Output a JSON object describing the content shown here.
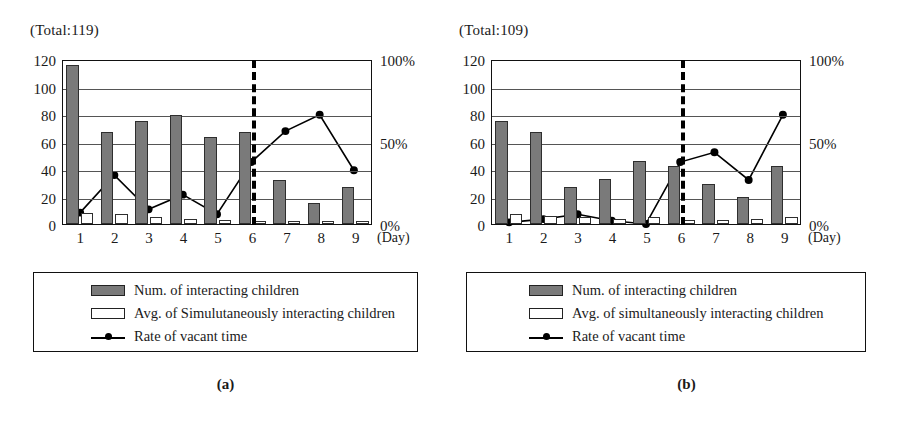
{
  "panels": [
    {
      "key": "a",
      "caption": "(a)",
      "total_label": "(Total:119)",
      "xaxis_title": "(Day)",
      "legend": {
        "bar_filled": "Num. of interacting children",
        "bar_hollow": "Avg. of Simulutaneously interacting children",
        "line": "Rate of vacant time"
      },
      "chart_data": {
        "type": "bar",
        "title": "(Total:119)",
        "xlabel": "(Day)",
        "ylabel": "",
        "y2label": "",
        "ylim": [
          0,
          120
        ],
        "y2lim": [
          0,
          100
        ],
        "yticks": [
          0,
          20,
          40,
          60,
          80,
          100,
          120
        ],
        "ytick_labels": [
          "0",
          "20",
          "40",
          "60",
          "80",
          "100",
          "120"
        ],
        "y2ticks": [
          0,
          50,
          100
        ],
        "y2tick_labels": [
          "0%",
          "50%",
          "100%"
        ],
        "grid": true,
        "legend_position": "below",
        "categories": [
          "1",
          "2",
          "3",
          "4",
          "5",
          "6",
          "7",
          "8",
          "9"
        ],
        "annotations": [
          {
            "type": "vertical-dashed-line",
            "x": 5.5,
            "label": ""
          }
        ],
        "series": [
          {
            "name": "Num. of interacting children",
            "type": "bar",
            "axis": "left",
            "values": [
              116,
              67,
              75,
              79,
              63,
              67,
              32,
              15,
              27
            ]
          },
          {
            "name": "Avg. of Simulutaneously interacting children",
            "type": "bar",
            "axis": "left",
            "values": [
              8,
              7,
              5,
              4,
              3,
              2,
              2,
              2,
              2
            ]
          },
          {
            "name": "Rate of vacant time",
            "type": "line",
            "axis": "right",
            "values": [
              7,
              30,
              9,
              18,
              6,
              38,
              57,
              67,
              33
            ]
          }
        ]
      }
    },
    {
      "key": "b",
      "caption": "(b)",
      "total_label": "(Total:109)",
      "xaxis_title": "(Day)",
      "legend": {
        "bar_filled": "Num. of interacting children",
        "bar_hollow": "Avg. of simultaneously interacting children",
        "line": "Rate of vacant time"
      },
      "chart_data": {
        "type": "bar",
        "title": "(Total:109)",
        "xlabel": "(Day)",
        "ylabel": "",
        "y2label": "",
        "ylim": [
          0,
          120
        ],
        "y2lim": [
          0,
          100
        ],
        "yticks": [
          0,
          20,
          40,
          60,
          80,
          100,
          120
        ],
        "ytick_labels": [
          "0",
          "20",
          "40",
          "60",
          "80",
          "100",
          "120"
        ],
        "y2ticks": [
          0,
          50,
          100
        ],
        "y2tick_labels": [
          "0%",
          "50%",
          "100%"
        ],
        "grid": true,
        "legend_position": "below",
        "categories": [
          "1",
          "2",
          "3",
          "4",
          "5",
          "6",
          "7",
          "8",
          "9"
        ],
        "annotations": [
          {
            "type": "vertical-dashed-line",
            "x": 5.5,
            "label": ""
          }
        ],
        "series": [
          {
            "name": "Num. of interacting children",
            "type": "bar",
            "axis": "left",
            "values": [
              75,
              67,
              27,
              33,
              46,
              42,
              29,
              20,
              42
            ]
          },
          {
            "name": "Avg. of simultaneously interacting children",
            "type": "bar",
            "axis": "left",
            "values": [
              7,
              6,
              5,
              4,
              5,
              3,
              3,
              4,
              5
            ]
          },
          {
            "name": "Rate of vacant time",
            "type": "line",
            "axis": "right",
            "values": [
              1,
              3,
              6,
              2,
              0,
              38,
              44,
              27,
              67
            ]
          }
        ]
      }
    }
  ]
}
